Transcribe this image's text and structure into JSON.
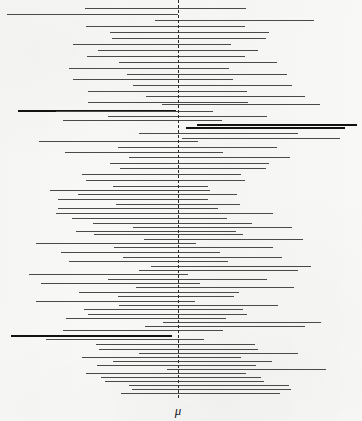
{
  "figure": {
    "name": "confidence-interval-coverage-plot",
    "width": 362,
    "height": 421,
    "background_color": "#f8f8f7"
  },
  "axis": {
    "mu_label": "μ",
    "mu_x": 178,
    "mu_label_x": 178,
    "mu_label_y": 404,
    "center_line_color": "#2b2b2b",
    "center_line_style": "dashed",
    "center_line_top": 0,
    "center_line_height": 398
  },
  "legend_colors": {
    "covers_mu": "#4a4a4a",
    "misses_mu": "#121212"
  },
  "chart_data": {
    "type": "interval",
    "title": "",
    "subtitle": "",
    "xlabel": "μ",
    "ylabel": "",
    "grid": false,
    "legend_position": "none",
    "annotations": [
      "μ"
    ],
    "reference_line_x": 178,
    "total_intervals": 50,
    "intervals_missing_mu": 4,
    "coverage_rate": "92%",
    "series": [
      {
        "name": "confidence intervals",
        "points": [
          {
            "y": 8,
            "left": 85,
            "right": 246,
            "covers": true
          },
          {
            "y": 14,
            "left": 7,
            "right": 168,
            "covers": true
          },
          {
            "y": 14,
            "left": 154,
            "right": 178,
            "covers": true
          },
          {
            "y": 20,
            "left": 155,
            "right": 314,
            "covers": true
          },
          {
            "y": 26,
            "left": 86,
            "right": 245,
            "covers": true
          },
          {
            "y": 32,
            "left": 110,
            "right": 269,
            "covers": true
          },
          {
            "y": 38,
            "left": 112,
            "right": 266,
            "covers": true
          },
          {
            "y": 44,
            "left": 73,
            "right": 231,
            "covers": true
          },
          {
            "y": 50,
            "left": 98,
            "right": 258,
            "covers": true
          },
          {
            "y": 56,
            "left": 87,
            "right": 245,
            "covers": true
          },
          {
            "y": 62,
            "left": 119,
            "right": 277,
            "covers": true
          },
          {
            "y": 68,
            "left": 69,
            "right": 229,
            "covers": true
          },
          {
            "y": 74,
            "left": 127,
            "right": 287,
            "covers": true
          },
          {
            "y": 79,
            "left": 73,
            "right": 233,
            "covers": true
          },
          {
            "y": 85,
            "left": 133,
            "right": 292,
            "covers": true
          },
          {
            "y": 91,
            "left": 88,
            "right": 247,
            "covers": true
          },
          {
            "y": 96,
            "left": 146,
            "right": 305,
            "covers": true
          },
          {
            "y": 102,
            "left": 88,
            "right": 248,
            "covers": true
          },
          {
            "y": 104,
            "left": 162,
            "right": 320,
            "covers": true
          },
          {
            "y": 110,
            "left": 18,
            "right": 176,
            "covers": false
          },
          {
            "y": 111,
            "left": 56,
            "right": 213,
            "covers": true
          },
          {
            "y": 116,
            "left": 108,
            "right": 267,
            "covers": true
          },
          {
            "y": 120,
            "left": 63,
            "right": 222,
            "covers": true
          },
          {
            "y": 124,
            "left": 197,
            "right": 357,
            "covers": false
          },
          {
            "y": 127,
            "left": 186,
            "right": 345,
            "covers": false
          },
          {
            "y": 133,
            "left": 139,
            "right": 298,
            "covers": true
          },
          {
            "y": 138,
            "left": 182,
            "right": 340,
            "covers": true
          },
          {
            "y": 141,
            "left": 39,
            "right": 198,
            "covers": true
          },
          {
            "y": 147,
            "left": 118,
            "right": 277,
            "covers": true
          },
          {
            "y": 152,
            "left": 65,
            "right": 223,
            "covers": true
          },
          {
            "y": 157,
            "left": 129,
            "right": 290,
            "covers": true
          },
          {
            "y": 163,
            "left": 110,
            "right": 269,
            "covers": true
          },
          {
            "y": 168,
            "left": 120,
            "right": 266,
            "covers": true
          },
          {
            "y": 174,
            "left": 82,
            "right": 241,
            "covers": true
          },
          {
            "y": 180,
            "left": 86,
            "right": 245,
            "covers": true
          },
          {
            "y": 186,
            "left": 113,
            "right": 208,
            "covers": true
          },
          {
            "y": 190,
            "left": 50,
            "right": 210,
            "covers": true
          },
          {
            "y": 194,
            "left": 78,
            "right": 237,
            "covers": true
          },
          {
            "y": 199,
            "left": 58,
            "right": 208,
            "covers": true
          },
          {
            "y": 204,
            "left": 116,
            "right": 240,
            "covers": true
          },
          {
            "y": 208,
            "left": 58,
            "right": 218,
            "covers": true
          },
          {
            "y": 213,
            "left": 56,
            "right": 273,
            "covers": true
          },
          {
            "y": 218,
            "left": 72,
            "right": 227,
            "covers": true
          },
          {
            "y": 223,
            "left": 93,
            "right": 252,
            "covers": true
          },
          {
            "y": 227,
            "left": 133,
            "right": 292,
            "covers": true
          },
          {
            "y": 231,
            "left": 76,
            "right": 236,
            "covers": true
          },
          {
            "y": 234,
            "left": 94,
            "right": 243,
            "covers": true
          },
          {
            "y": 239,
            "left": 144,
            "right": 303,
            "covers": true
          },
          {
            "y": 243,
            "left": 36,
            "right": 196,
            "covers": true
          },
          {
            "y": 247,
            "left": 114,
            "right": 273,
            "covers": true
          },
          {
            "y": 252,
            "left": 61,
            "right": 220,
            "covers": true
          },
          {
            "y": 257,
            "left": 123,
            "right": 282,
            "covers": true
          },
          {
            "y": 261,
            "left": 69,
            "right": 228,
            "covers": true
          },
          {
            "y": 266,
            "left": 151,
            "right": 311,
            "covers": true
          },
          {
            "y": 270,
            "left": 139,
            "right": 298,
            "covers": true
          },
          {
            "y": 274,
            "left": 29,
            "right": 188,
            "covers": true
          },
          {
            "y": 279,
            "left": 108,
            "right": 267,
            "covers": true
          },
          {
            "y": 283,
            "left": 41,
            "right": 200,
            "covers": true
          },
          {
            "y": 287,
            "left": 136,
            "right": 294,
            "covers": true
          },
          {
            "y": 292,
            "left": 79,
            "right": 239,
            "covers": true
          },
          {
            "y": 296,
            "left": 118,
            "right": 234,
            "covers": true
          },
          {
            "y": 301,
            "left": 36,
            "right": 195,
            "covers": true
          },
          {
            "y": 305,
            "left": 119,
            "right": 278,
            "covers": true
          },
          {
            "y": 309,
            "left": 84,
            "right": 243,
            "covers": true
          },
          {
            "y": 314,
            "left": 88,
            "right": 247,
            "covers": true
          },
          {
            "y": 318,
            "left": 66,
            "right": 226,
            "covers": true
          },
          {
            "y": 322,
            "left": 163,
            "right": 321,
            "covers": true
          },
          {
            "y": 326,
            "left": 145,
            "right": 305,
            "covers": true
          },
          {
            "y": 330,
            "left": 63,
            "right": 223,
            "covers": true
          },
          {
            "y": 335,
            "left": 11,
            "right": 172,
            "covers": false
          },
          {
            "y": 339,
            "left": 46,
            "right": 204,
            "covers": true
          },
          {
            "y": 344,
            "left": 96,
            "right": 255,
            "covers": true
          },
          {
            "y": 349,
            "left": 99,
            "right": 258,
            "covers": true
          },
          {
            "y": 353,
            "left": 139,
            "right": 298,
            "covers": true
          },
          {
            "y": 357,
            "left": 82,
            "right": 241,
            "covers": true
          },
          {
            "y": 361,
            "left": 113,
            "right": 272,
            "covers": true
          },
          {
            "y": 365,
            "left": 97,
            "right": 256,
            "covers": true
          },
          {
            "y": 369,
            "left": 167,
            "right": 326,
            "covers": true
          },
          {
            "y": 373,
            "left": 86,
            "right": 246,
            "covers": true
          },
          {
            "y": 377,
            "left": 101,
            "right": 261,
            "covers": true
          },
          {
            "y": 381,
            "left": 105,
            "right": 264,
            "covers": true
          },
          {
            "y": 385,
            "left": 129,
            "right": 289,
            "covers": true
          },
          {
            "y": 389,
            "left": 132,
            "right": 291,
            "covers": true
          },
          {
            "y": 393,
            "left": 121,
            "right": 280,
            "covers": true
          }
        ]
      }
    ]
  }
}
